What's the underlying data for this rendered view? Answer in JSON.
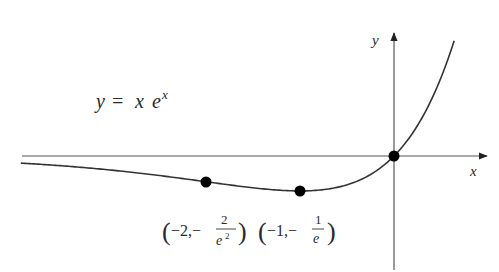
{
  "chart_data": {
    "type": "line",
    "function": "x * exp(x)",
    "xlabel": "x",
    "ylabel": "y",
    "xlim": [
      -4.0,
      1.0
    ],
    "ylim": [
      -1.2,
      1.3
    ],
    "grid": false,
    "ticks": false,
    "series": [
      {
        "name": "y = x e^x",
        "x_range": [
          -3.97,
          0.64
        ]
      }
    ],
    "marked_points": [
      {
        "label": "(-2, -2/e^2)",
        "x": -2,
        "y": -0.2707,
        "note": "inflection point"
      },
      {
        "label": "(-1, -1/e)",
        "x": -1,
        "y": -0.3679,
        "note": "minimum"
      },
      {
        "label": "(0, 0)",
        "x": 0,
        "y": 0,
        "note": "origin"
      }
    ]
  },
  "labels": {
    "equation_y": "y",
    "equation_eq": "=",
    "equation_x": "x",
    "equation_e": "e",
    "equation_exp": "x",
    "axis_x": "x",
    "axis_y": "y",
    "point1_num_a": "−2,−",
    "point1_frac_num": "2",
    "point1_frac_den_e": "e",
    "point1_frac_den_exp": "2",
    "point2_num_a": "−1,−",
    "point2_frac_num": "1",
    "point2_frac_den": "e"
  },
  "colors": {
    "curve": "#333333",
    "axes": "#555555",
    "points": "#000000"
  }
}
